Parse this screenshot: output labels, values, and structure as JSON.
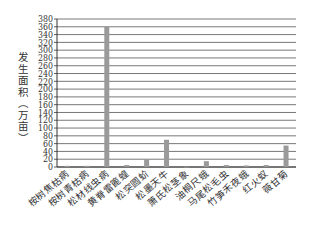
{
  "chart_data": {
    "type": "bar",
    "title": "",
    "xlabel": "",
    "ylabel": "发生面积（万亩）",
    "ylim": [
      0,
      380
    ],
    "yticks": [
      0,
      20,
      40,
      60,
      80,
      100,
      120,
      140,
      160,
      180,
      200,
      220,
      240,
      260,
      280,
      300,
      320,
      340,
      360,
      380
    ],
    "grid": true,
    "legend": null,
    "bar_color": "#9a9a9a",
    "categories": [
      "桉树焦枯病",
      "桉树青枯病",
      "松材线虫病",
      "黄脊雷篦蝗",
      "松突圆蚧",
      "松墨天牛",
      "萧氏松茎象",
      "油桐尺蛾",
      "马尾松毛虫",
      "竹笋禾夜蛾",
      "红火蚁",
      "薇甘菊"
    ],
    "values": [
      3,
      3,
      360,
      5,
      20,
      70,
      1,
      15,
      5,
      4,
      5,
      55
    ]
  }
}
